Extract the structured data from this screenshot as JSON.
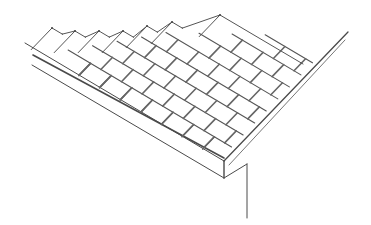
{
  "figure": {
    "title": "",
    "stroke_color": "#4a4a4a",
    "light_stroke_color": "#7a7a7a",
    "background": "#ffffff"
  },
  "geometry": {
    "eave_dir": [
      1,
      0.593
    ],
    "rake_dir": [
      1,
      -1.04
    ],
    "corner_top": [
      224,
      161
    ],
    "corner_bottom": [
      224,
      178
    ],
    "fascia_right": [
      247,
      164
    ],
    "post_bottom": [
      247,
      218
    ],
    "eave_top_start": [
      25,
      43
    ],
    "eave_bottom_start": [
      32,
      65
    ],
    "rake_outer_end": [
      348,
      32
    ],
    "rake_inner_start": [
      229,
      165
    ],
    "rake_inner_end": [
      345,
      40
    ],
    "shingle_edge_start": [
      33,
      55
    ],
    "shingle_edge_end": [
      224,
      158
    ],
    "courses": 8,
    "course_depth": 11.5,
    "tab_width": 24,
    "ridge_peaks": [
      [
        52,
        28
      ],
      [
        75,
        31
      ],
      [
        99,
        31
      ],
      [
        123,
        31
      ],
      [
        147,
        26
      ],
      [
        172,
        22
      ],
      [
        220,
        15
      ]
    ]
  }
}
